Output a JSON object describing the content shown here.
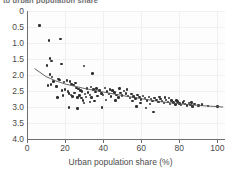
{
  "figure": {
    "clipped_title": "to urban population share",
    "background": "#ffffff",
    "point_color": "#2f2f2f",
    "trend_color": "#555555",
    "grid_color": "#f0f0f0"
  },
  "axis": {
    "y_ticks": [
      "4.0",
      "3.5",
      "3.0",
      "2.5",
      "2.0",
      "1.5",
      "1.0",
      "0.5",
      "0"
    ],
    "y_tick_values": [
      4.0,
      3.5,
      3.0,
      2.5,
      2.0,
      1.5,
      1.0,
      0.5,
      0
    ],
    "x_ticks": [
      "0",
      "20",
      "40",
      "60",
      "80",
      "100"
    ],
    "x_tick_values": [
      0,
      20,
      40,
      60,
      80,
      100
    ],
    "x_title": "Urban population share (%)",
    "y_title": ""
  },
  "chart_data": {
    "type": "scatter",
    "title": "to urban population share",
    "xlabel": "Urban population share (%)",
    "ylabel": "",
    "xlim": [
      0,
      104
    ],
    "ylim": [
      0,
      4.0
    ],
    "grid": true,
    "legend": "none",
    "x_ticks": [
      0,
      20,
      40,
      60,
      80,
      100
    ],
    "y_ticks": [
      0,
      0.5,
      1.0,
      1.5,
      2.0,
      2.5,
      3.0,
      3.5,
      4.0
    ],
    "series": [
      {
        "name": "countries",
        "marker": "filled-circle",
        "points": [
          [
            6.5,
            3.55
          ],
          [
            11.5,
            3.08
          ],
          [
            17.5,
            3.13
          ],
          [
            12.2,
            2.52
          ],
          [
            12.8,
            2.43
          ],
          [
            18.0,
            2.35
          ],
          [
            10.5,
            2.3
          ],
          [
            30.0,
            2.28
          ],
          [
            12.0,
            2.02
          ],
          [
            13.0,
            1.93
          ],
          [
            34.5,
            2.04
          ],
          [
            16.5,
            1.88
          ],
          [
            17.0,
            1.85
          ],
          [
            14.0,
            1.8
          ],
          [
            11.0,
            1.67
          ],
          [
            12.5,
            1.7
          ],
          [
            15.5,
            1.64
          ],
          [
            19.5,
            1.78
          ],
          [
            21.0,
            1.83
          ],
          [
            22.5,
            1.8
          ],
          [
            23.5,
            1.72
          ],
          [
            24.5,
            1.68
          ],
          [
            25.5,
            1.75
          ],
          [
            26.0,
            1.6
          ],
          [
            27.0,
            1.57
          ],
          [
            28.0,
            1.52
          ],
          [
            20.0,
            1.55
          ],
          [
            21.5,
            1.48
          ],
          [
            22.0,
            1.42
          ],
          [
            23.0,
            1.38
          ],
          [
            24.0,
            1.33
          ],
          [
            25.0,
            1.44
          ],
          [
            26.5,
            1.3
          ],
          [
            27.5,
            1.36
          ],
          [
            28.5,
            1.28
          ],
          [
            29.0,
            1.48
          ],
          [
            30.5,
            1.4
          ],
          [
            31.0,
            1.32
          ],
          [
            32.0,
            1.45
          ],
          [
            33.0,
            1.38
          ],
          [
            34.0,
            1.3
          ],
          [
            35.0,
            1.55
          ],
          [
            36.0,
            1.47
          ],
          [
            37.0,
            1.35
          ],
          [
            38.0,
            1.52
          ],
          [
            39.0,
            1.42
          ],
          [
            40.0,
            1.37
          ],
          [
            41.0,
            1.6
          ],
          [
            42.0,
            1.48
          ],
          [
            43.0,
            1.4
          ],
          [
            44.0,
            1.33
          ],
          [
            45.0,
            1.52
          ],
          [
            46.0,
            1.45
          ],
          [
            47.0,
            1.38
          ],
          [
            48.0,
            1.3
          ],
          [
            49.0,
            1.43
          ],
          [
            50.0,
            1.36
          ],
          [
            51.0,
            1.5
          ],
          [
            52.0,
            1.42
          ],
          [
            53.0,
            1.35
          ],
          [
            54.0,
            1.28
          ],
          [
            55.0,
            1.4
          ],
          [
            56.0,
            1.33
          ],
          [
            57.0,
            1.26
          ],
          [
            58.0,
            1.38
          ],
          [
            59.0,
            1.31
          ],
          [
            60.0,
            1.24
          ],
          [
            61.0,
            1.35
          ],
          [
            62.0,
            1.28
          ],
          [
            63.0,
            1.21
          ],
          [
            64.0,
            1.32
          ],
          [
            65.0,
            1.25
          ],
          [
            66.0,
            1.18
          ],
          [
            67.0,
            1.28
          ],
          [
            68.0,
            1.22
          ],
          [
            69.0,
            1.15
          ],
          [
            70.0,
            1.25
          ],
          [
            71.0,
            1.19
          ],
          [
            72.0,
            1.12
          ],
          [
            73.0,
            1.22
          ],
          [
            74.0,
            1.16
          ],
          [
            75.0,
            1.1
          ],
          [
            76.0,
            1.2
          ],
          [
            77.0,
            1.14
          ],
          [
            78.0,
            1.08
          ],
          [
            79.0,
            1.17
          ],
          [
            80.0,
            1.11
          ],
          [
            81.0,
            1.06
          ],
          [
            82.0,
            1.14
          ],
          [
            83.0,
            1.09
          ],
          [
            84.0,
            1.04
          ],
          [
            85.0,
            1.12
          ],
          [
            86.0,
            1.07
          ],
          [
            87.0,
            1.02
          ],
          [
            88.0,
            1.1
          ],
          [
            90.0,
            1.05
          ],
          [
            92.0,
            1.08
          ],
          [
            95.0,
            1.03
          ],
          [
            100.0,
            1.02
          ],
          [
            22.0,
            0.98
          ],
          [
            26.5,
            0.95
          ],
          [
            39.5,
            0.98
          ],
          [
            57.5,
            1.02
          ],
          [
            62.5,
            0.97
          ],
          [
            66.5,
            0.84
          ],
          [
            18.5,
            1.52
          ],
          [
            19.0,
            1.36
          ],
          [
            16.0,
            1.3
          ],
          [
            31.5,
            1.58
          ],
          [
            33.5,
            1.62
          ],
          [
            36.5,
            1.58
          ],
          [
            43.5,
            1.55
          ],
          [
            48.5,
            1.58
          ],
          [
            52.5,
            1.55
          ],
          [
            29.5,
            1.2
          ],
          [
            30.0,
            1.12
          ],
          [
            33.0,
            1.15
          ],
          [
            35.5,
            1.18
          ],
          [
            41.5,
            1.22
          ],
          [
            46.5,
            1.2
          ],
          [
            55.5,
            1.18
          ],
          [
            59.5,
            1.12
          ],
          [
            64.5,
            1.1
          ],
          [
            69.5,
            1.32
          ],
          [
            72.5,
            1.3
          ],
          [
            74.5,
            1.28
          ],
          [
            78.5,
            1.2
          ],
          [
            82.5,
            1.18
          ],
          [
            86.5,
            1.14
          ]
        ]
      }
    ],
    "trend_line": {
      "name": "fitted trend",
      "style": "solid",
      "points": [
        [
          4.0,
          2.2
        ],
        [
          10.0,
          1.95
        ],
        [
          15.0,
          1.82
        ],
        [
          20.0,
          1.72
        ],
        [
          30.0,
          1.58
        ],
        [
          40.0,
          1.47
        ],
        [
          50.0,
          1.36
        ],
        [
          60.0,
          1.26
        ],
        [
          70.0,
          1.17
        ],
        [
          80.0,
          1.1
        ],
        [
          90.0,
          1.05
        ],
        [
          103.0,
          1.0
        ]
      ]
    }
  }
}
